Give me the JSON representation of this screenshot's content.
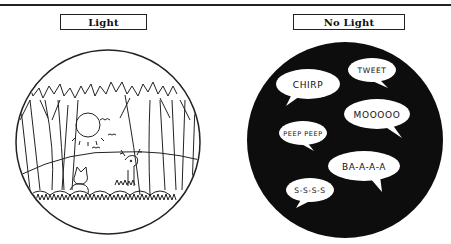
{
  "panels": {
    "light": {
      "label": "Light",
      "scene": "forest-daylight",
      "elements": [
        "trees",
        "sun",
        "birds",
        "deer",
        "fox",
        "grass"
      ]
    },
    "no_light": {
      "label": "No Light",
      "scene": "darkness",
      "bubbles": [
        {
          "text": "CHIRP"
        },
        {
          "text": "TWEET"
        },
        {
          "text": "MOOOOO"
        },
        {
          "text": "PEEP PEEP"
        },
        {
          "text": "BA-A-A-A"
        },
        {
          "text": "S-S-S-S"
        }
      ]
    }
  },
  "colors": {
    "ink": "#111111",
    "background": "#ffffff",
    "night": "#0d0d0d"
  }
}
